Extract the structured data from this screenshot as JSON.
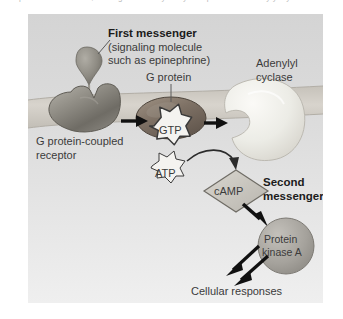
{
  "figure": {
    "title_cutoff_line": "the plasma membrane, the signal is relayed by a G protein to adenylyl cyclase",
    "panel": {
      "background_top": "#d6d6d6",
      "background_bottom": "#ededed",
      "membrane_color": "#cfcbc4"
    }
  },
  "labels": {
    "first_messenger": {
      "line1": "First messenger",
      "line2": "(signaling molecule",
      "line3": "such as epinephrine)"
    },
    "g_protein": "G protein",
    "adenylyl_cyclase": {
      "line1": "Adenylyl",
      "line2": "cyclase"
    },
    "gpcr": {
      "line1": "G protein-coupled",
      "line2": "receptor"
    },
    "second_messenger": {
      "line1": "Second",
      "line2": "messenger"
    },
    "cellular_responses": "Cellular responses"
  },
  "molecules": {
    "gtp": "GTP",
    "atp": "ATP",
    "camp": "cAMP",
    "protein_kinase_a": {
      "line1": "Protein",
      "line2": "kinase A"
    }
  },
  "colors": {
    "receptor_fill": "#8f8c84",
    "g_protein_fill": "#7b6f63",
    "adenylyl_cyclase_fill": "#e6e3dc",
    "camp_fill": "#c9c6bf",
    "kinase_fill": "#a9a6a0",
    "ligand_fill": "#8f8c84",
    "arrow_color": "#111111",
    "burst_fill": "#f4f3f0",
    "text_color": "#3b3b3b"
  }
}
